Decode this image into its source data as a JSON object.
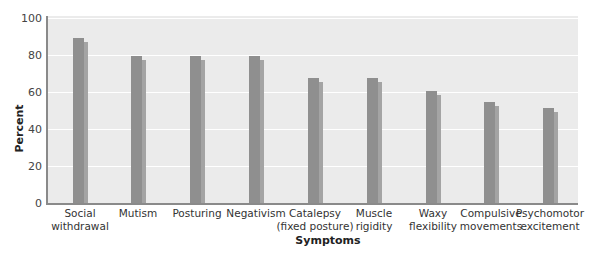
{
  "chart_data": {
    "type": "bar",
    "title": "",
    "xlabel": "Symptoms",
    "ylabel": "Percent",
    "ylim": [
      0,
      100
    ],
    "yticks": [
      "0",
      "20",
      "40",
      "60",
      "80",
      "100"
    ],
    "grid": true,
    "legend": null,
    "categories": [
      [
        "Social",
        "withdrawal"
      ],
      [
        "Mutism",
        ""
      ],
      [
        "Posturing",
        ""
      ],
      [
        "Negativism",
        ""
      ],
      [
        "Catalepsy",
        "(fixed posture)"
      ],
      [
        "Muscle",
        "rigidity"
      ],
      [
        "Waxy",
        "flexibility"
      ],
      [
        "Compulsive",
        "movements"
      ],
      [
        "Psychomotor",
        "excitement"
      ]
    ],
    "category_names": [
      "Social withdrawal",
      "Mutism",
      "Posturing",
      "Negativism",
      "Catalepsy (fixed posture)",
      "Muscle rigidity",
      "Waxy flexibility",
      "Compulsive movements",
      "Psychomotor excitement"
    ],
    "values": [
      90,
      80,
      80,
      80,
      68,
      68,
      61,
      55,
      52
    ]
  },
  "colors": {
    "bar": "#8f8f8f",
    "bar_shadow": "#a4a4a4",
    "plot_bg": "#ebebeb",
    "grid": "#ffffff",
    "axis": "#8a8a8a"
  }
}
